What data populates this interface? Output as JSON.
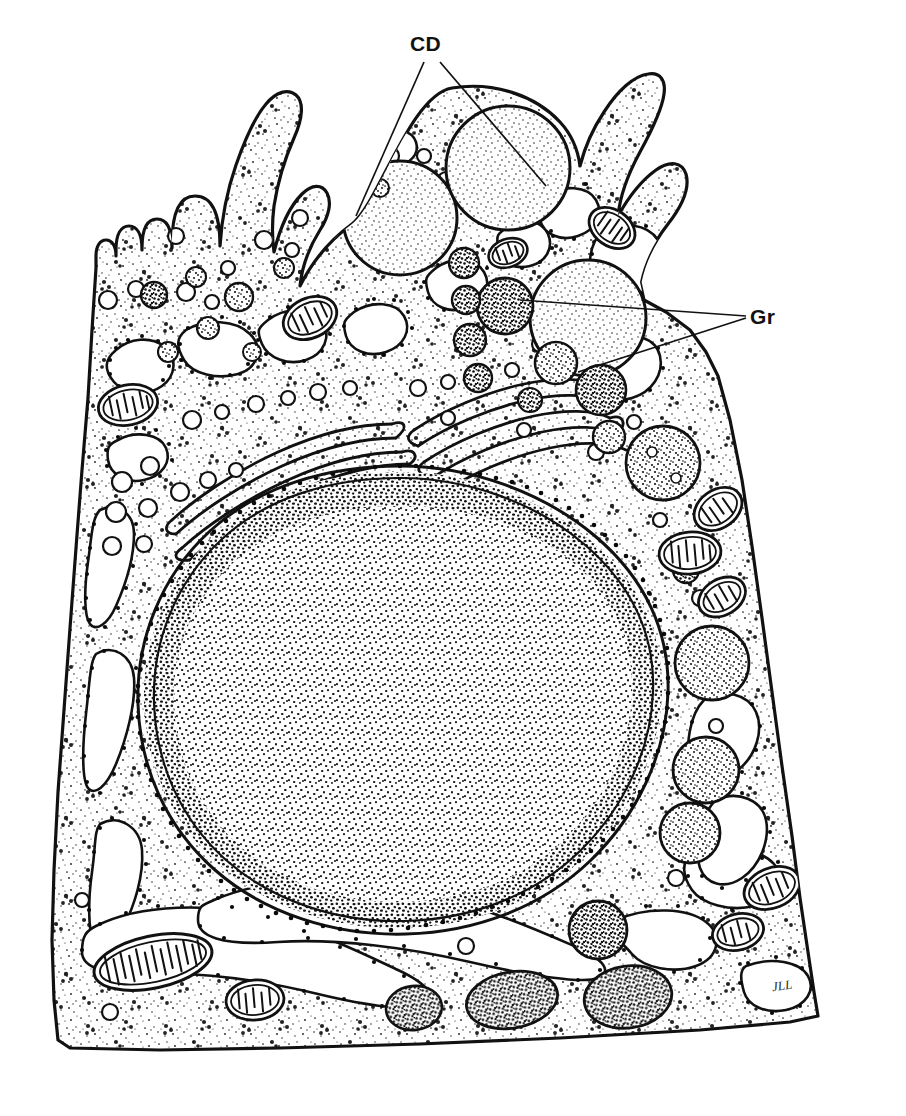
{
  "figure": {
    "kind": "scientific-line-drawing",
    "background_color": "#ffffff",
    "ink_color": "#111111",
    "width": 906,
    "height": 1116
  },
  "labels": [
    {
      "id": "cd",
      "text": "CD",
      "meaning": "condensing vacuoles",
      "x": 410,
      "y": 32
    },
    {
      "id": "gr",
      "text": "Gr",
      "meaning": "secretory granules",
      "x": 750,
      "y": 305
    }
  ],
  "signature": {
    "text": "JLL"
  },
  "leader_lines": {
    "cd": [
      {
        "from": [
          425,
          60
        ],
        "to": [
          355,
          215
        ]
      },
      {
        "from": [
          440,
          60
        ],
        "to": [
          545,
          185
        ]
      }
    ],
    "gr": [
      {
        "from": [
          745,
          318
        ],
        "to": [
          520,
          300
        ]
      },
      {
        "from": [
          745,
          318
        ],
        "to": [
          580,
          372
        ]
      }
    ]
  },
  "structures": {
    "cell_membrane": "irregular quadrilateral outline with apical microvilli",
    "microvilli_count": 11,
    "nucleus": {
      "cx": 400,
      "cy": 700,
      "rx": 262,
      "ry": 228,
      "chromatin": "dense stipple",
      "envelope": "double membrane studded with ribosomes"
    },
    "golgi": {
      "stacks": 2,
      "cisternae_per_stack": 5,
      "region": "supranuclear left-of-center"
    },
    "condensing_vacuoles": [
      {
        "cx": 400,
        "cy": 218,
        "r": 57
      },
      {
        "cx": 508,
        "cy": 168,
        "r": 62
      },
      {
        "cx": 588,
        "cy": 318,
        "r": 58
      }
    ],
    "secretory_granules": [
      {
        "cx": 505,
        "cy": 306,
        "r": 28,
        "tone": "dark"
      },
      {
        "cx": 556,
        "cy": 363,
        "r": 21,
        "tone": "medium"
      },
      {
        "cx": 464,
        "cy": 263,
        "r": 15,
        "tone": "dark"
      },
      {
        "cx": 466,
        "cy": 300,
        "r": 14,
        "tone": "dark"
      },
      {
        "cx": 470,
        "cy": 340,
        "r": 16,
        "tone": "dark"
      },
      {
        "cx": 478,
        "cy": 378,
        "r": 14,
        "tone": "dark"
      },
      {
        "cx": 601,
        "cy": 390,
        "r": 25,
        "tone": "dark"
      },
      {
        "cx": 663,
        "cy": 463,
        "r": 37,
        "tone": "medium"
      },
      {
        "cx": 609,
        "cy": 437,
        "r": 16,
        "tone": "medium"
      },
      {
        "cx": 686,
        "cy": 570,
        "r": 13,
        "tone": "dark"
      },
      {
        "cx": 712,
        "cy": 663,
        "r": 37,
        "tone": "medium"
      },
      {
        "cx": 706,
        "cy": 770,
        "r": 33,
        "tone": "medium"
      },
      {
        "cx": 690,
        "cy": 833,
        "r": 30,
        "tone": "medium"
      },
      {
        "cx": 598,
        "cy": 930,
        "r": 29,
        "tone": "dark"
      },
      {
        "cx": 628,
        "cy": 997,
        "r": 33,
        "tone": "dark"
      },
      {
        "cx": 512,
        "cy": 1000,
        "r": 31,
        "tone": "dark"
      },
      {
        "cx": 348,
        "cy": 197,
        "r": 11,
        "tone": "dark"
      },
      {
        "cx": 239,
        "cy": 297,
        "r": 14,
        "tone": "medium"
      },
      {
        "cx": 154,
        "cy": 295,
        "r": 13,
        "tone": "dark"
      }
    ],
    "mitochondria": [
      {
        "cx": 508,
        "cy": 253,
        "rx": 20,
        "ry": 14,
        "rot": -20
      },
      {
        "cx": 612,
        "cy": 228,
        "rx": 25,
        "ry": 18,
        "rot": 35
      },
      {
        "cx": 310,
        "cy": 318,
        "rx": 28,
        "ry": 20,
        "rot": -25
      },
      {
        "cx": 128,
        "cy": 405,
        "rx": 30,
        "ry": 20,
        "rot": -15
      },
      {
        "cx": 718,
        "cy": 509,
        "rx": 24,
        "ry": 18,
        "rot": -35
      },
      {
        "cx": 690,
        "cy": 553,
        "rx": 30,
        "ry": 21,
        "rot": -8
      },
      {
        "cx": 722,
        "cy": 597,
        "rx": 24,
        "ry": 18,
        "rot": -30
      },
      {
        "cx": 153,
        "cy": 962,
        "rx": 58,
        "ry": 25,
        "rot": -12
      },
      {
        "cx": 255,
        "cy": 1000,
        "rx": 27,
        "ry": 19,
        "rot": -5
      },
      {
        "cx": 772,
        "cy": 888,
        "rx": 28,
        "ry": 19,
        "rot": -22
      },
      {
        "cx": 735,
        "cy": 932,
        "rx": 26,
        "ry": 18,
        "rot": -15
      }
    ],
    "rough_er": "branched ribbon cisternae studded with ribosomes, peripheral and basal",
    "free_ribosomes": "scattered dot clusters throughout cytoplasm",
    "cytoplasm_texture": "fine stipple"
  }
}
